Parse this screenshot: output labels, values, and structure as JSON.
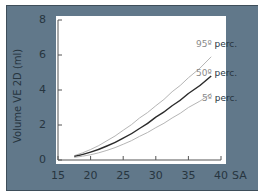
{
  "chart_data": {
    "type": "line",
    "title": "",
    "xlabel": "SA",
    "ylabel": "Volume VE 2D (ml)",
    "xlim": [
      15,
      40
    ],
    "ylim": [
      0,
      8
    ],
    "x_ticks": [
      "15",
      "20",
      "25",
      "30",
      "35",
      "40"
    ],
    "y_ticks": [
      "0",
      "2",
      "4",
      "6",
      "8"
    ],
    "grid": false,
    "legend_position": "inline-right",
    "x": [
      17.5,
      20,
      22.5,
      25,
      27.5,
      30,
      32.5,
      35,
      38.5
    ],
    "series": [
      {
        "name": "95º perc.",
        "color": "#b5b5b5",
        "values": [
          0.25,
          0.6,
          1.1,
          1.7,
          2.4,
          3.1,
          3.9,
          4.7,
          5.9
        ]
      },
      {
        "name": "50º perc.",
        "color": "#2b2b2b",
        "values": [
          0.2,
          0.45,
          0.8,
          1.25,
          1.8,
          2.45,
          3.1,
          3.8,
          4.8
        ]
      },
      {
        "name": "5º perc.",
        "color": "#b5b5b5",
        "values": [
          0.15,
          0.3,
          0.55,
          0.9,
          1.35,
          1.85,
          2.4,
          3.0,
          3.8
        ]
      }
    ]
  },
  "labels": {
    "ylabel": "Volume VE 2D (ml)",
    "xlabel": "SA",
    "p95_num": "95º",
    "p50_num": "50º",
    "p5_num": "5º",
    "perc": "perc."
  }
}
